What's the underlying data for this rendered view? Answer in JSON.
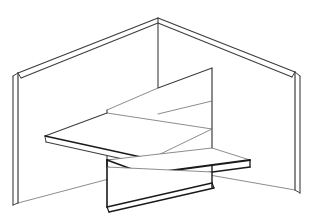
{
  "document": {
    "title": "Isometric Alcove Line Drawing",
    "type": "technical-line-drawing",
    "width": 313,
    "height": 217,
    "background_color": "#ffffff"
  },
  "style": {
    "stroke_dark": "#1a1a1a",
    "stroke_mid": "#3d3d3d",
    "stroke_light": "#6e6e6e",
    "fill_white": "#ffffff",
    "weight_heavy": 1.9,
    "weight_medium": 1.2,
    "weight_light": 0.7
  },
  "scene": {
    "description": "Wireframe perspective drawing of a corner alcove formed by two wall panels meeting at a vertical corner, with a cantilevered shelf on the left, an interior partition panel, and a raised bench platform slab with a vertical riser below.",
    "parts": [
      {
        "name": "left-wall-panel",
        "label": "Left wall panel"
      },
      {
        "name": "right-wall-panel",
        "label": "Right wall panel"
      },
      {
        "name": "corner-seam",
        "label": "Corner seam"
      },
      {
        "name": "interior-partition",
        "label": "Interior partition"
      },
      {
        "name": "cantilever-shelf",
        "label": "Cantilever shelf"
      },
      {
        "name": "bench-platform",
        "label": "Bench platform"
      },
      {
        "name": "bench-riser",
        "label": "Bench riser"
      }
    ]
  },
  "geometry": {
    "left_wall": {
      "face": "18,73 158,18 158,166 18,203",
      "top_edge": "18,73 158,18",
      "top_thickness_edge": "21,78 158,23",
      "left_edge": "18,73 18,203",
      "left_thickness_edge": "13,76 13,205",
      "left_cap_top": "13,76 18,73",
      "left_cap_bottom": "13,205 18,203",
      "bottom_edge": "18,203 158,166"
    },
    "right_wall": {
      "face": "158,18 295,72 295,190 158,166",
      "top_edge": "158,18 295,72",
      "top_thickness_edge": "158,23 292,77",
      "right_edge": "295,72 295,190",
      "right_thickness_edge": "300,76 300,193",
      "right_cap_top": "295,72 300,76",
      "right_cap_bottom": "295,190 300,193",
      "bottom_edge": "158,166 295,190"
    },
    "corner_seam": {
      "vertical": "158,18 158,166",
      "apex": "158,18",
      "base": "158,166"
    },
    "partition": {
      "top_edge": "158,88 212,68",
      "right_vertical": "212,68 212,165",
      "mid_edge": "158,114 212,101",
      "bottom_edge": "107,160 212,165",
      "left_vertical": "107,110 107,160",
      "inner_diag": "107,110 158,88"
    },
    "shelf": {
      "tip": "45,136",
      "top_face": "45,136 107,113 212,129 150,159",
      "front_edge_top": "45,136 150,159",
      "front_edge_bottom": "46,142 150,165",
      "tip_cap": "45,136 46,142",
      "back_edge": "45,136 107,113",
      "right_edge": "107,113 212,129"
    },
    "bench": {
      "top_face": "107,160 212,148 250,160 145,174",
      "top_left": "107,160 212,148",
      "top_right": "212,148 250,160",
      "front_left": "107,160 145,174",
      "front_right": "145,174 250,160",
      "thickness_left": "107,167 145,181",
      "thickness_right": "145,181 250,167",
      "riser_left_vertical": "107,160 107,207",
      "riser_bottom": "107,207 212,183",
      "riser_bottom_thickness": "109,212 214,188",
      "riser_right_vertical": "212,165 212,188",
      "riser_front_edge": "107,167 212,172"
    }
  },
  "annotations": {
    "visible_text": []
  }
}
